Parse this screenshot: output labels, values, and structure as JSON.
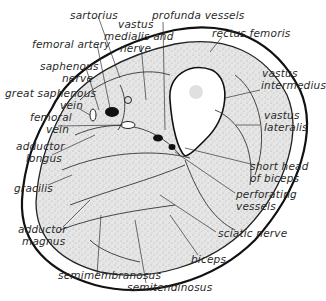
{
  "diagram": {
    "type": "anatomical cross-section",
    "colors": {
      "outline": "#1a1a1a",
      "muscle_fill": "#d9d9d9",
      "fat_ring": "#ffffff",
      "vessel": "#111111",
      "bone": "#ffffff"
    },
    "labels": {
      "sartorius": "sartorius",
      "vastus_medialis_l1": "vastus",
      "vastus_medialis_l2": "medialis and",
      "vastus_medialis_l3": "nerve",
      "profunda": "profunda vessels",
      "rectus": "rectus femoris",
      "femoral_artery": "femoral artery",
      "saphenous_nerve_l1": "saphenous",
      "saphenous_nerve_l2": "nerve",
      "great_saphenous_l1": "great saphenous",
      "great_saphenous_l2": "vein",
      "femoral_vein_l1": "femoral",
      "femoral_vein_l2": "vein",
      "vastus_intermedius_l1": "vastus",
      "vastus_intermedius_l2": "intermedius",
      "vastus_lateralis_l1": "vastus",
      "vastus_lateralis_l2": "lateralis",
      "adductor_longus_l1": "adductor",
      "adductor_longus_l2": "longus",
      "gracilis": "gracilis",
      "short_head_l1": "short head",
      "short_head_l2": "of biceps",
      "perforating_l1": "perforating",
      "perforating_l2": "vessels",
      "adductor_magnus_l1": "adductor",
      "adductor_magnus_l2": "magnus",
      "sciatic": "sciatic nerve",
      "biceps": "biceps",
      "semimembranosus": "semimembranosus",
      "semitendinosus": "semitendinosus"
    }
  }
}
